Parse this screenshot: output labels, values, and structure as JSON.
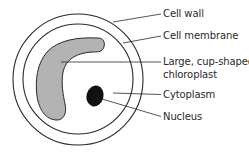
{
  "diagram": {
    "colors": {
      "stroke": "#2a2a2a",
      "chloroplast_fill": "#b3b3b3",
      "nucleus_fill": "#111111",
      "background": "#ffffff"
    },
    "labels": [
      {
        "id": "cell-wall",
        "text": "Cell wall"
      },
      {
        "id": "cell-membrane",
        "text": "Cell membrane"
      },
      {
        "id": "chloroplast-line1",
        "text": "Large, cup-shaped"
      },
      {
        "id": "chloroplast-line2",
        "text": "chloroplast"
      },
      {
        "id": "cytoplasm",
        "text": "Cytoplasm"
      },
      {
        "id": "nucleus",
        "text": "Nucleus"
      }
    ]
  }
}
